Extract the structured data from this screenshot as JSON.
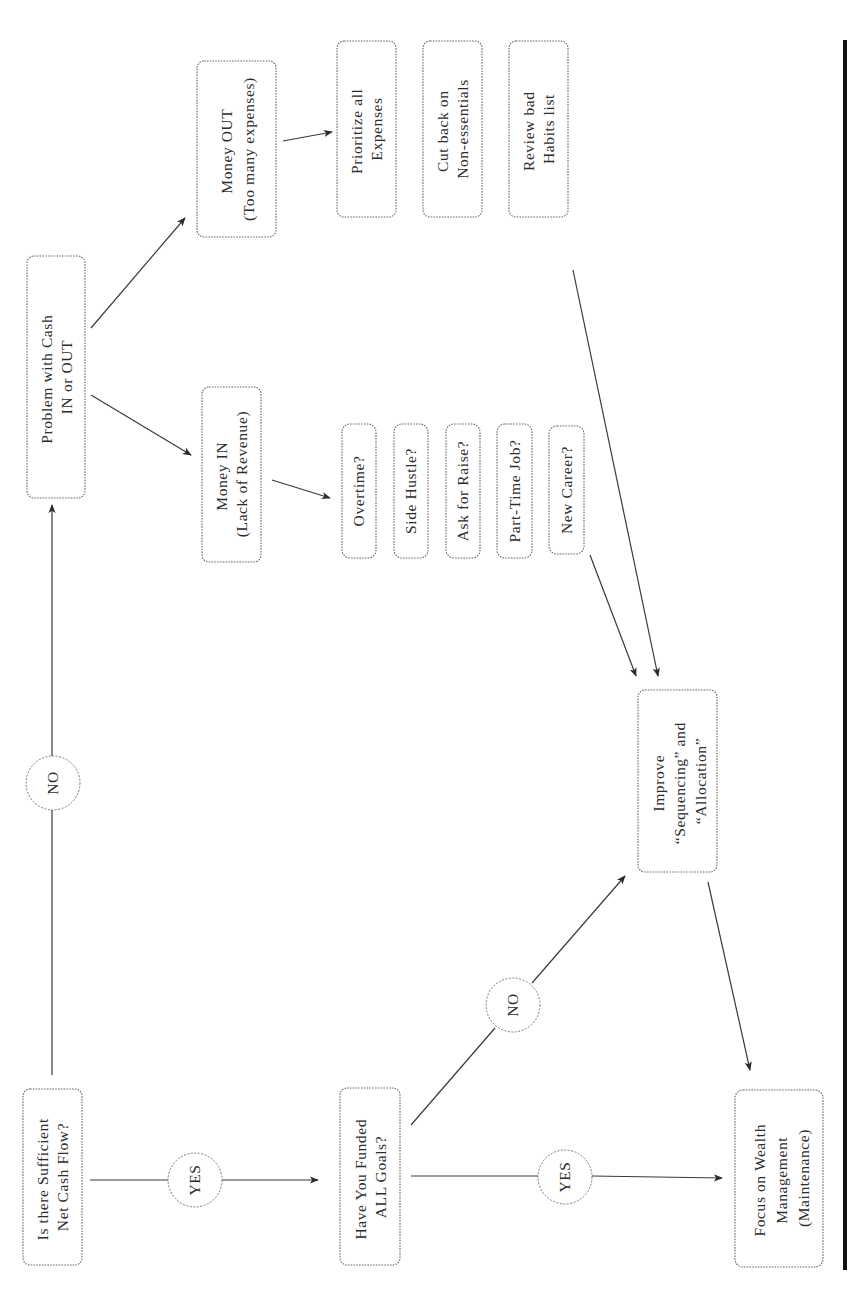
{
  "diagram": {
    "orientation": "rotated-90-ccw",
    "nodes": {
      "start": {
        "lines": [
          "Is there Sufficient",
          "Net Cash Flow?"
        ]
      },
      "problem": {
        "lines": [
          "Problem with Cash",
          "IN or OUT"
        ]
      },
      "money_out": {
        "lines": [
          "Money OUT",
          "(Too many expenses)"
        ]
      },
      "money_in": {
        "lines": [
          "Money IN",
          "(Lack of Revenue)"
        ]
      },
      "prioritize": {
        "lines": [
          "Prioritize all",
          "Expenses"
        ]
      },
      "cut_back": {
        "lines": [
          "Cut back on",
          "Non-essentials"
        ]
      },
      "review": {
        "lines": [
          "Review bad",
          "Habits list"
        ]
      },
      "overtime": {
        "lines": [
          "Overtime?"
        ]
      },
      "side_hustle": {
        "lines": [
          "Side Hustle?"
        ]
      },
      "ask_raise": {
        "lines": [
          "Ask for Raise?"
        ]
      },
      "part_time": {
        "lines": [
          "Part-Time Job?"
        ]
      },
      "new_career": {
        "lines": [
          "New Career?"
        ]
      },
      "funded": {
        "lines": [
          "Have You Funded",
          "ALL Goals?"
        ]
      },
      "improve": {
        "lines": [
          "Improve",
          "“Sequencing” and",
          "“Allocation”"
        ]
      },
      "focus": {
        "lines": [
          "Focus on Wealth",
          "Management",
          "(Maintenance)"
        ]
      }
    },
    "decisions": {
      "start_yes": "YES",
      "start_no": "NO",
      "funded_yes": "YES",
      "funded_no": "NO"
    },
    "edges": [
      {
        "from": "start",
        "to": "funded",
        "label": "YES"
      },
      {
        "from": "start",
        "to": "problem",
        "label": "NO"
      },
      {
        "from": "problem",
        "to": "money_out"
      },
      {
        "from": "problem",
        "to": "money_in"
      },
      {
        "from": "money_out",
        "to": "prioritize"
      },
      {
        "from": "money_in",
        "to": "overtime"
      },
      {
        "from": "new_career",
        "to": "improve"
      },
      {
        "from": "review",
        "to": "improve"
      },
      {
        "from": "funded",
        "to": "focus",
        "label": "YES"
      },
      {
        "from": "funded",
        "to": "improve",
        "label": "NO"
      },
      {
        "from": "improve",
        "to": "focus"
      }
    ],
    "colors": {
      "ink": "#2c2c2c",
      "border": "#6a6a6a",
      "rule": "#111111"
    }
  }
}
